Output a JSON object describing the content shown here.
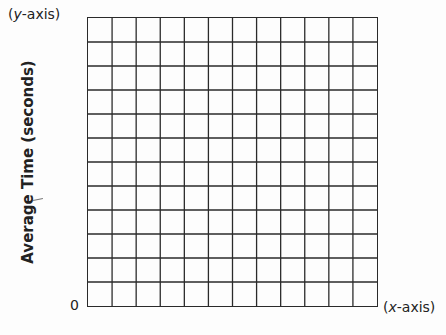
{
  "chart_data": {
    "type": "line",
    "title": "",
    "xlabel": "(x-axis)",
    "ylabel": "Average Time (seconds)",
    "y_axis_tag": "(y-axis)",
    "origin_label": "0",
    "grid": true,
    "grid_columns": 12,
    "grid_rows": 12,
    "series": [],
    "x": [],
    "values": [],
    "note": "Blank graph-paper template; no data plotted"
  },
  "labels": {
    "y_axis_open": "(",
    "y_axis_var": "y",
    "y_axis_rest": "-axis)",
    "x_axis_open": "(",
    "x_axis_var": "x",
    "x_axis_rest": "-axis)",
    "origin": "0",
    "y_title": "Average Time (seconds)"
  },
  "colors": {
    "grid_line": "#2a2a2a",
    "text": "#222222",
    "background": "#fdfdfd"
  }
}
